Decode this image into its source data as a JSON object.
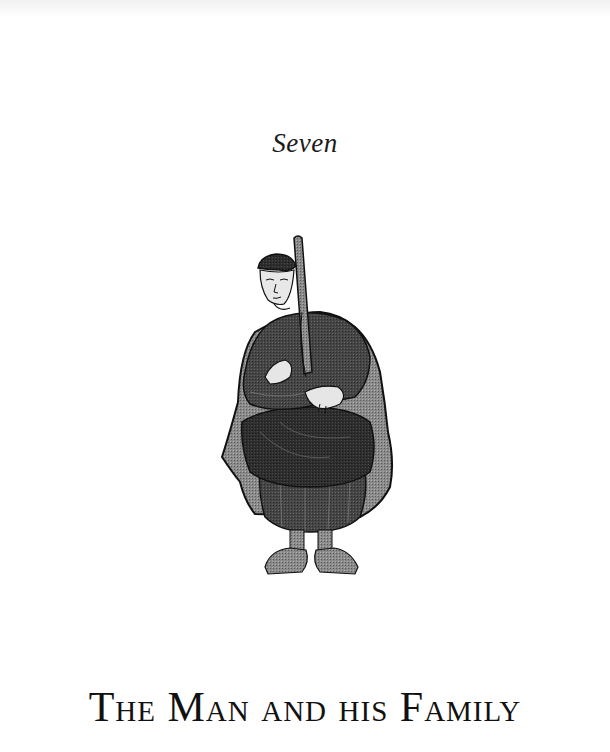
{
  "page": {
    "chapter_number": "Seven",
    "chapter_title": "The Man and his Family"
  },
  "illustration": {
    "subject": "medieval-seated-man-with-staff",
    "colors": {
      "robe_dark": "#2a2a2a",
      "robe_mid": "#3c3c3c",
      "cloak": "#7a7a7a",
      "skin": "#e6e6e6",
      "outline": "#111111"
    }
  }
}
